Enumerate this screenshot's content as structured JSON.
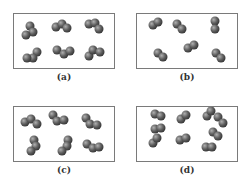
{
  "panels": [
    {
      "label": "(a)",
      "description": "six triatomic molecules"
    },
    {
      "label": "(b)",
      "description": "six diatomic molecules"
    },
    {
      "label": "(c)",
      "description": "six triatomic molecules"
    },
    {
      "label": "(d)",
      "description": "nine diatomic molecules"
    }
  ],
  "colors": {
    "atom_fill": "#5a5a5a",
    "atom_highlight": "#9a9a9a",
    "border": "#7a7a7a"
  }
}
